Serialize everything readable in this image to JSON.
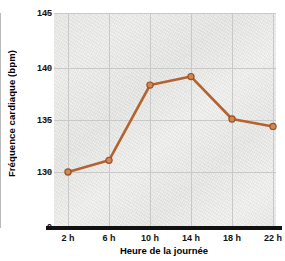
{
  "chart_data": {
    "type": "line",
    "title": "",
    "xlabel": "Heure de la journée",
    "ylabel": "Fréquence cardiaque (bpm)",
    "categories": [
      "2 h",
      "6 h",
      "10 h",
      "14 h",
      "18 h",
      "22 h"
    ],
    "x": [
      2,
      6,
      10,
      14,
      18,
      22
    ],
    "values": [
      130.0,
      131.1,
      138.2,
      139.0,
      135.0,
      134.3
    ],
    "series": [
      {
        "name": "Fréquence cardiaque",
        "values": [
          130.0,
          131.1,
          138.2,
          139.0,
          135.0,
          134.3
        ]
      }
    ],
    "ylim": [
      129.0,
      145.0
    ],
    "yticks": [
      130,
      135,
      140,
      145
    ],
    "ytick_labels": [
      "130",
      "135",
      "140",
      "145"
    ],
    "y_origin_label": "0",
    "axis_broken": true,
    "grid": true,
    "legend": "none",
    "marker": "circle",
    "line_color": "#b4622e",
    "marker_face_color": "#c98a5a",
    "marker_edge_color": "#9e4f22",
    "plot_bg_color": "#e9e9e7",
    "gridline_color": "#c9c9c7",
    "axis_color": "#111111"
  },
  "ytick_labels": [
    {
      "text": "145"
    },
    {
      "text": "140"
    },
    {
      "text": "135"
    },
    {
      "text": "130"
    },
    {
      "text": "0"
    }
  ],
  "xtick_labels": [
    {
      "text": "2 h"
    },
    {
      "text": "6 h"
    },
    {
      "text": "10 h"
    },
    {
      "text": "14 h"
    },
    {
      "text": "18 h"
    },
    {
      "text": "22 h"
    }
  ]
}
